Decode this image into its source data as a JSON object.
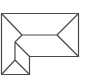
{
  "diagram": {
    "icon": "roof-plan-icon",
    "stroke_color": "#4a4a4a",
    "background": "#ffffff"
  }
}
